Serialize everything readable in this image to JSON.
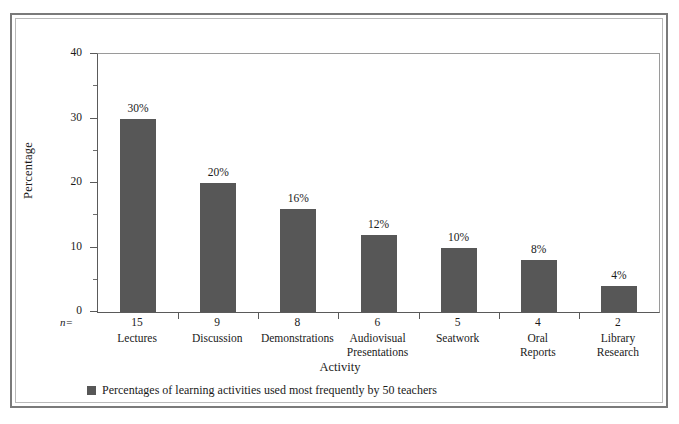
{
  "chart_data": {
    "type": "bar",
    "title": "",
    "subtitle": "",
    "xlabel": "Activity",
    "ylabel": "Percentage",
    "categories": [
      "Lectures",
      "Discussion",
      "Demonstrations",
      "Audiovisual Presentations",
      "Seatwork",
      "Oral Reports",
      "Library Research"
    ],
    "category_lines": [
      [
        "Lectures"
      ],
      [
        "Discussion"
      ],
      [
        "Demonstrations"
      ],
      [
        "Audiovisual",
        "Presentations"
      ],
      [
        "Seatwork"
      ],
      [
        "Oral",
        "Reports"
      ],
      [
        "Library",
        "Research"
      ]
    ],
    "values": [
      30,
      20,
      16,
      12,
      10,
      8,
      4
    ],
    "data_labels": [
      "30%",
      "20%",
      "16%",
      "12%",
      "10%",
      "8%",
      "4%"
    ],
    "n_values": [
      15,
      9,
      8,
      6,
      5,
      4,
      2
    ],
    "n_prefix": "n=",
    "ylim": [
      0,
      40
    ],
    "y_major_ticks": [
      0,
      10,
      20,
      30,
      40
    ],
    "y_major_tick_labels": [
      "0",
      "10",
      "20",
      "30",
      "40"
    ],
    "y_minor_ticks": [
      5,
      15,
      25,
      35
    ],
    "grid": false,
    "legend_position": "bottom-left",
    "legend": [
      {
        "label": "Percentages of learning activities used most frequently by 50 teachers",
        "color": "#575757"
      }
    ],
    "bar_color": "#575757",
    "axis_color": "#5a5a5a",
    "background_color": "#ffffff",
    "frame_color": "#7a7a7a"
  }
}
